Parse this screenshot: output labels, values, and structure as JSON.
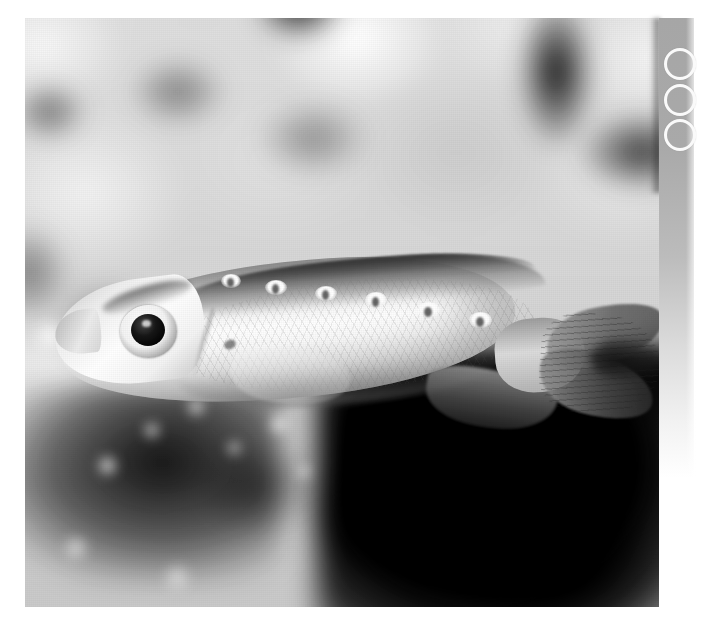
{
  "page": {
    "width": 717,
    "height": 630,
    "background_color": "#ffffff",
    "kind": "scanned-photograph-plate"
  },
  "photo": {
    "alt_text": "Underwater photograph of a pale elongate reef fish in left profile against a blurred rocky coral background",
    "subject": "reef fish",
    "orientation": "facing left",
    "color_mode": "grayscale",
    "bounds": {
      "x": 25,
      "y": 18,
      "width": 634,
      "height": 589
    },
    "background_description": "out-of-focus mottled reef rock, bright above and to the left, deep black shadow across the lower right quadrant",
    "tones": {
      "highlight": "#fafafa",
      "midtone": "#b8b8b8",
      "shadow": "#0a0a0a",
      "body_light": "#f7f7f7",
      "body_mid": "#cfcfcf",
      "dorsal_dark": "#4a4a4a"
    },
    "fish_features": [
      {
        "name": "eye",
        "description": "large round dark pupil within a pale iris ring"
      },
      {
        "name": "snout",
        "description": "short blunt tapering snout at the left"
      },
      {
        "name": "dorsal-fin",
        "description": "long low dark-edged fin running the length of the back"
      },
      {
        "name": "pectoral-fin",
        "description": "translucent fan-shaped fin behind the gill cover"
      },
      {
        "name": "anal-fin",
        "description": "dark fin on the lower rear flank"
      },
      {
        "name": "caudal-fin",
        "description": "forked tail with trailing upper and lower lobes"
      },
      {
        "name": "dorsal-spot-row",
        "description": "row of pale light marks with small dark centers along the upper flank"
      },
      {
        "name": "scales",
        "description": "fine diamond scale texture across the flank"
      }
    ],
    "dorsal_spots": [
      {
        "x": 196,
        "y": 256,
        "w": 20,
        "h": 14,
        "dot_x": 202,
        "dot_y": 260,
        "dot_w": 7,
        "dot_h": 9
      },
      {
        "x": 240,
        "y": 262,
        "w": 22,
        "h": 15,
        "dot_x": 247,
        "dot_y": 266,
        "dot_w": 7,
        "dot_h": 10
      },
      {
        "x": 290,
        "y": 268,
        "w": 22,
        "h": 15,
        "dot_x": 297,
        "dot_y": 272,
        "dot_w": 7,
        "dot_h": 10
      },
      {
        "x": 340,
        "y": 274,
        "w": 22,
        "h": 15,
        "dot_x": 347,
        "dot_y": 279,
        "dot_w": 7,
        "dot_h": 10
      },
      {
        "x": 392,
        "y": 284,
        "w": 23,
        "h": 16,
        "dot_x": 399,
        "dot_y": 289,
        "dot_w": 8,
        "dot_h": 10
      },
      {
        "x": 444,
        "y": 294,
        "w": 23,
        "h": 16,
        "dot_x": 451,
        "dot_y": 299,
        "dot_w": 8,
        "dot_h": 10
      }
    ]
  },
  "gutter": {
    "description": "vertical gray scanner gutter strip along the right edge fading to white toward the bottom",
    "top_color": "#a6a6a6",
    "bottom_color": "#ffffff",
    "rings": [
      {
        "label": "ring-1"
      },
      {
        "label": "ring-2"
      },
      {
        "label": "ring-3"
      }
    ],
    "ring_color": "#fafafa"
  }
}
